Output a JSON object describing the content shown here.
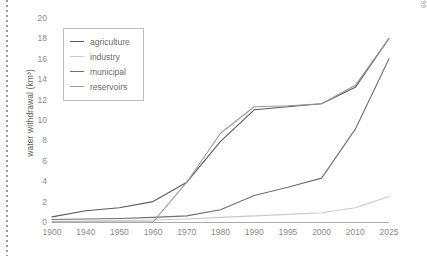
{
  "figure": {
    "source_note": "Source: Shiklomanov 1999"
  },
  "chart_data": {
    "type": "line",
    "title": "",
    "xlabel": "",
    "ylabel": "water withdrawal (km³)",
    "categories": [
      "1900",
      "1940",
      "1950",
      "1960",
      "1970",
      "1980",
      "1990",
      "1995",
      "2000",
      "2010",
      "2025"
    ],
    "yticks": [
      0,
      2,
      4,
      6,
      8,
      10,
      12,
      14,
      16,
      18,
      20
    ],
    "ylim": [
      0,
      20
    ],
    "grid": false,
    "legend_position": "upper-left",
    "series": [
      {
        "name": "agriculture",
        "color": "#5a5a5a",
        "values": [
          0.5,
          1.1,
          1.4,
          2.0,
          3.9,
          7.9,
          11.0,
          11.3,
          11.6,
          13.2,
          18.0
        ]
      },
      {
        "name": "industry",
        "color": "#c9c9c9",
        "values": [
          0.05,
          0.1,
          0.15,
          0.2,
          0.3,
          0.45,
          0.6,
          0.75,
          0.9,
          1.4,
          2.5
        ]
      },
      {
        "name": "municipal",
        "color": "#6f6f6f",
        "values": [
          0.25,
          0.3,
          0.35,
          0.45,
          0.6,
          1.2,
          2.6,
          3.4,
          4.3,
          9.1,
          16.0
        ]
      },
      {
        "name": "reservoirs",
        "color": "#9a9a9a",
        "values": [
          0.0,
          0.0,
          0.0,
          0.0,
          3.9,
          8.7,
          11.3,
          11.4,
          11.6,
          13.4,
          18.0
        ]
      }
    ]
  }
}
